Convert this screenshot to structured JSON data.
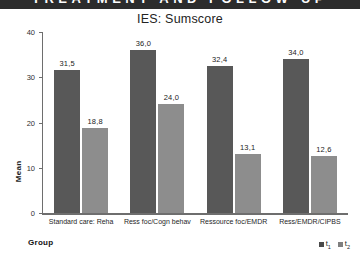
{
  "banner": {
    "text": "TREATMENT AND FOLLOW-UP"
  },
  "chart_data": {
    "type": "bar",
    "title": "IES: Sumscore",
    "xlabel": "Group",
    "ylabel": "Mean",
    "ylim": [
      0,
      40
    ],
    "yticks": [
      "0",
      "10",
      "20",
      "30",
      "40"
    ],
    "grid": false,
    "legend_position": "bottom-right",
    "categories": [
      "Standard care: Reha",
      "Ress foc/Cogn behav",
      "Ressource foc/EMDR",
      "Ress/EMDR/CIPBS"
    ],
    "series": [
      {
        "name": "t1",
        "legend_label": "t",
        "legend_sub": "1",
        "color": "#585858",
        "values": [
          31.5,
          36.0,
          32.4,
          34.0
        ],
        "labels": [
          "31,5",
          "36,0",
          "32,4",
          "34,0"
        ]
      },
      {
        "name": "t2",
        "legend_label": "t",
        "legend_sub": "2",
        "color": "#8d8d8d",
        "values": [
          18.8,
          24.0,
          13.1,
          12.6
        ],
        "labels": [
          "18,8",
          "24,0",
          "13,1",
          "12,6"
        ]
      }
    ]
  }
}
